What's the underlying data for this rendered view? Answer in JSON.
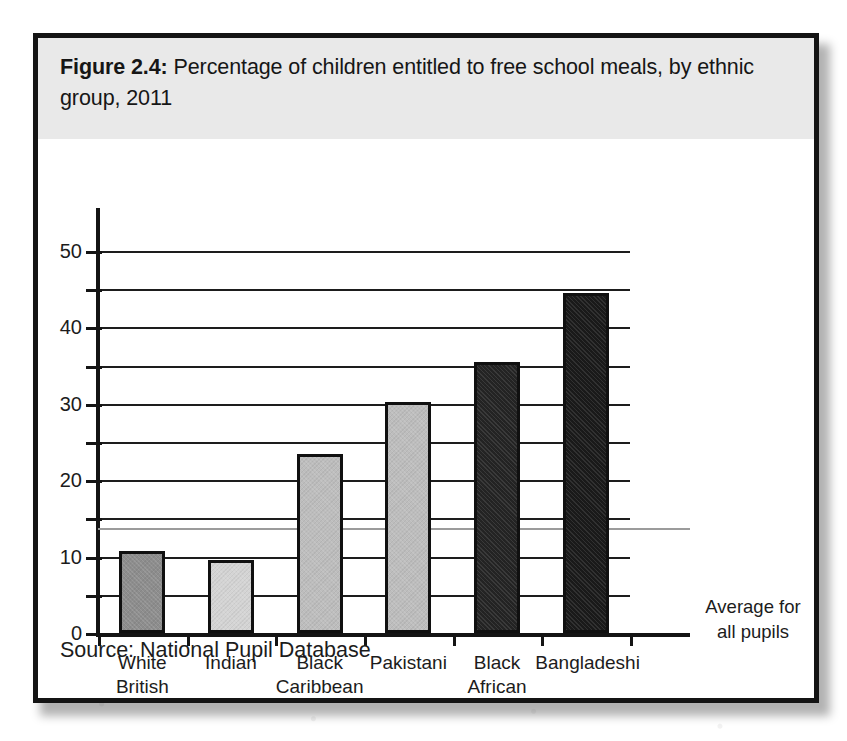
{
  "figure": {
    "number_label": "Figure 2.4:",
    "title_rest": " Percentage of children entitled to free school meals, by ethnic group, 2011",
    "source": "Source: National Pupil Database",
    "average_annotation_line1": "Average for",
    "average_annotation_line2": "all pupils"
  },
  "chart_data": {
    "type": "bar",
    "title": "Figure 2.4: Percentage of children entitled to free school meals, by ethnic group, 2011",
    "xlabel": "",
    "ylabel": "",
    "ylim": [
      0,
      55
    ],
    "grid": true,
    "legend_position": "none",
    "categories": [
      "White British",
      "Indian",
      "Black Caribbean",
      "Pakistani",
      "Black African",
      "Bangladeshi"
    ],
    "category_lines": [
      [
        "White",
        "British"
      ],
      [
        "Indian",
        ""
      ],
      [
        "Black",
        "Caribbean"
      ],
      [
        "Pakistani",
        ""
      ],
      [
        "Black",
        "African"
      ],
      [
        "Bangladeshi",
        ""
      ]
    ],
    "values": [
      10.8,
      9.5,
      23.4,
      30.3,
      35.5,
      44.5
    ],
    "bar_colors": [
      "#8d8d8d",
      "#d4d4d4",
      "#bdbdbd",
      "#bdbdbd",
      "#242424",
      "#1a1a1a"
    ],
    "y_major_ticks": [
      0,
      10,
      20,
      30,
      40,
      50
    ],
    "y_major_tick_labels": [
      "0",
      "10",
      "20",
      "30",
      "40",
      "50"
    ],
    "y_minor_ticks": [
      5,
      15,
      25,
      35,
      45
    ],
    "annotations": [
      {
        "name": "average-for-all-pupils",
        "value": 13.8,
        "label": "Average for all pupils",
        "color": "#9b9b9b"
      }
    ]
  },
  "colors": {
    "title_band": "#e9e9e9",
    "border": "#141414",
    "axis": "#141414",
    "gridline": "#1d1d1d",
    "average_line": "#9b9b9b",
    "text": "#1c1c1c"
  }
}
